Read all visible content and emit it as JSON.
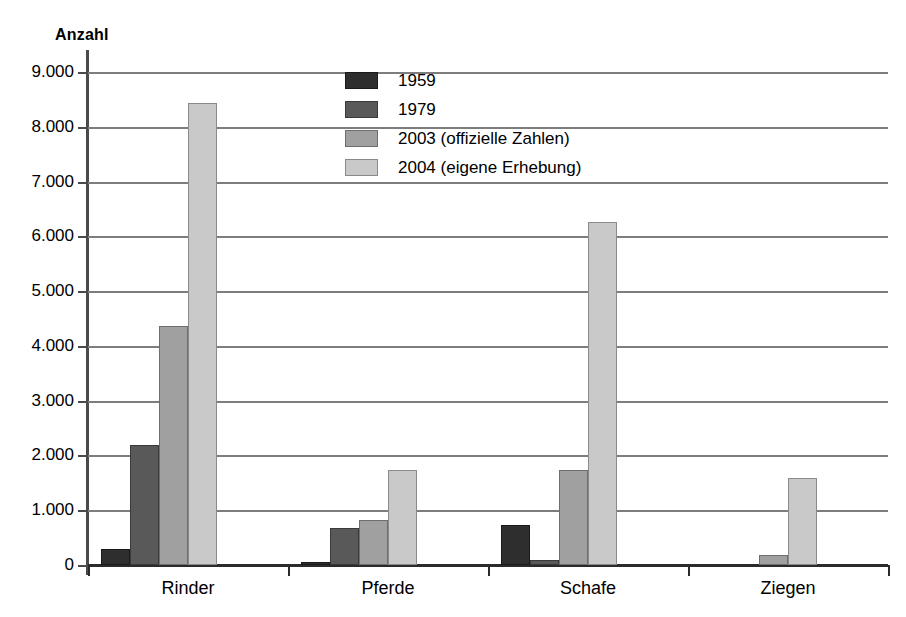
{
  "chart_data": {
    "type": "bar",
    "title": "",
    "ylabel": "Anzahl",
    "xlabel": "",
    "categories": [
      "Rinder",
      "Pferde",
      "Schafe",
      "Ziegen"
    ],
    "series": [
      {
        "name": "1959",
        "color": "#2e2e2e",
        "values": [
          300,
          60,
          730,
          0
        ]
      },
      {
        "name": "1979",
        "color": "#595959",
        "values": [
          2190,
          670,
          90,
          0
        ]
      },
      {
        "name": "2003 (offizielle Zahlen)",
        "color": "#a0a0a0",
        "values": [
          4360,
          820,
          1740,
          190
        ]
      },
      {
        "name": "2004 (eigene Erhebung)",
        "color": "#c9c9c9",
        "values": [
          8440,
          1740,
          6260,
          1580
        ]
      }
    ],
    "ylim": [
      0,
      9000
    ],
    "ytick_values": [
      0,
      1000,
      2000,
      3000,
      4000,
      5000,
      6000,
      7000,
      8000,
      9000
    ],
    "ytick_labels": [
      "0",
      "1.000",
      "2.000",
      "3.000",
      "4.000",
      "5.000",
      "6.000",
      "7.000",
      "8.000",
      "9.000"
    ],
    "grid": true,
    "legend_position": "upper-center"
  }
}
